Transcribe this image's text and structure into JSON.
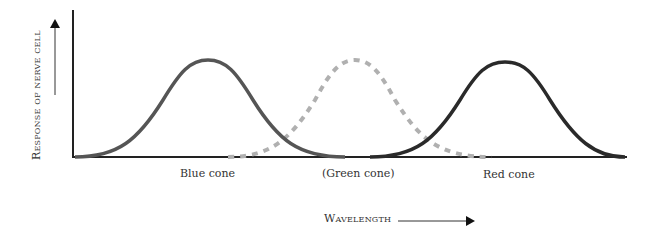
{
  "diagram": {
    "y_axis_label": "Response of nerve cell",
    "x_axis_label": "Wavelength",
    "curves": [
      {
        "name": "blue-cone",
        "label": "Blue cone",
        "style": "solid",
        "color": "#555555",
        "peak_x": 208
      },
      {
        "name": "green-cone",
        "label": "(Green cone)",
        "style": "dashed",
        "color": "#b0b0b0",
        "peak_x": 355
      },
      {
        "name": "red-cone",
        "label": "Red cone",
        "style": "solid",
        "color": "#2a2a2a",
        "peak_x": 505
      }
    ]
  }
}
